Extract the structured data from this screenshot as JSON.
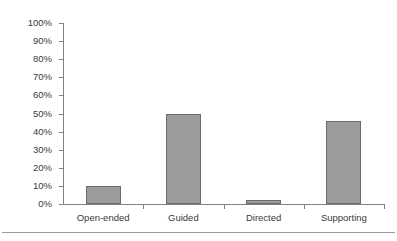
{
  "chart_data": {
    "type": "bar",
    "title": "",
    "subtitle": "",
    "xlabel": "",
    "ylabel": "",
    "categories": [
      "Open-ended",
      "Guided",
      "Directed",
      "Supporting"
    ],
    "values": [
      10,
      50,
      2,
      46
    ],
    "series": [
      {
        "name": "",
        "values": [
          10,
          50,
          2,
          46
        ]
      }
    ],
    "ylim": [
      0,
      100
    ],
    "ytick_values": [
      0,
      10,
      20,
      30,
      40,
      50,
      60,
      70,
      80,
      90,
      100
    ],
    "ytick_labels": [
      "0%",
      "10%",
      "20%",
      "30%",
      "40%",
      "50%",
      "60%",
      "70%",
      "80%",
      "90%",
      "100%"
    ],
    "grid": false,
    "legend": false,
    "legend_position": "none",
    "value_format": "percent",
    "annotations": []
  },
  "style": {
    "bar_fill": "#9c9c9c",
    "bar_border": "#6b6b6b",
    "axis_color": "#808080",
    "text_color": "#3a3a3a",
    "background": "#ffffff",
    "rule_color": "#9a9a9a"
  }
}
